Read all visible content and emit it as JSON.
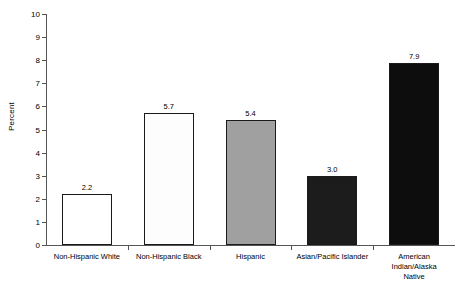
{
  "chart_data": {
    "type": "bar",
    "title": "",
    "xlabel": "",
    "ylabel": "Percent",
    "ylim": [
      0,
      10
    ],
    "ytick_labels": [
      "0",
      "1",
      "2",
      "3",
      "4",
      "5",
      "6",
      "7",
      "8",
      "9",
      "10"
    ],
    "grid": false,
    "legend": "none",
    "categories": [
      "Non-Hispanic White",
      "Non-Hispanic Black",
      "Hispanic",
      "Asian/Pacific Islander",
      "American\nIndian/Alaska Native"
    ],
    "values": [
      2.2,
      5.7,
      5.4,
      3.0,
      7.9
    ],
    "value_labels": [
      "2.2",
      "5.7",
      "5.4",
      "3.0",
      "7.9"
    ],
    "bar_colors": [
      "#ffffff",
      "#fdfdfd",
      "#a0a0a0",
      "#1c1c1c",
      "#0d0d0d"
    ],
    "bar_edge_color": "#1a1a1a",
    "axis_color": "#555555",
    "background": "#ffffff"
  }
}
